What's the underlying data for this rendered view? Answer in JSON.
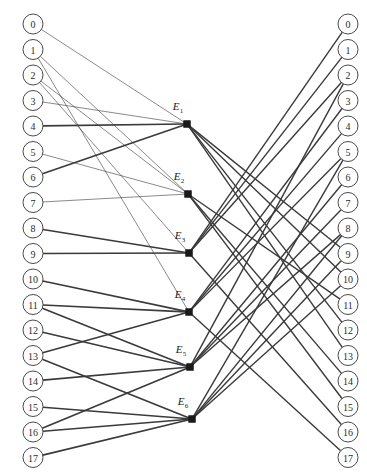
{
  "figure": {
    "type": "bipartite-flow-diagram",
    "width": 367,
    "height": 474,
    "background": "#ffffff",
    "edge_color": "#3a3a3a",
    "node_stroke": "#4a4a4a",
    "node_fill": "#ffffff",
    "middle_node_color": "#1a1a1a"
  },
  "left_column": {
    "name": "input-nodes",
    "x": 33,
    "start_y": 24,
    "spacing": 25.5,
    "radius": 10,
    "labels": [
      "0",
      "1",
      "2",
      "3",
      "4",
      "5",
      "6",
      "7",
      "8",
      "9",
      "10",
      "11",
      "12",
      "13",
      "14",
      "15",
      "16",
      "17"
    ]
  },
  "right_column": {
    "name": "output-nodes",
    "x": 348,
    "start_y": 24,
    "spacing": 25.5,
    "radius": 10,
    "labels": [
      "0",
      "1",
      "2",
      "3",
      "4",
      "5",
      "6",
      "7",
      "8",
      "9",
      "10",
      "11",
      "12",
      "13",
      "14",
      "15",
      "16",
      "17"
    ]
  },
  "middle_column": {
    "name": "relay-nodes",
    "nodes": [
      {
        "id": "E1",
        "base": "E",
        "sub": "1",
        "x": 187,
        "y": 124,
        "label_x": 178,
        "label_y": 110
      },
      {
        "id": "E2",
        "base": "E",
        "sub": "2",
        "x": 188,
        "y": 194,
        "label_x": 179,
        "label_y": 180
      },
      {
        "id": "E3",
        "base": "E",
        "sub": "3",
        "x": 189,
        "y": 253,
        "label_x": 180,
        "label_y": 239
      },
      {
        "id": "E4",
        "base": "E",
        "sub": "4",
        "x": 189,
        "y": 312,
        "label_x": 180,
        "label_y": 298
      },
      {
        "id": "E5",
        "base": "E",
        "sub": "5",
        "x": 190,
        "y": 367,
        "label_x": 181,
        "label_y": 353
      },
      {
        "id": "E6",
        "base": "E",
        "sub": "6",
        "x": 192,
        "y": 419,
        "label_x": 183,
        "label_y": 405
      }
    ]
  },
  "edges_left": [
    {
      "from": 0,
      "to": "E1",
      "weight": 0.6
    },
    {
      "from": 3,
      "to": "E1",
      "weight": 0.6
    },
    {
      "from": 4,
      "to": "E1",
      "weight": 1.6
    },
    {
      "from": 6,
      "to": "E1",
      "weight": 1.6
    },
    {
      "from": 1,
      "to": "E2",
      "weight": 0.6
    },
    {
      "from": 2,
      "to": "E2",
      "weight": 0.6
    },
    {
      "from": 5,
      "to": "E2",
      "weight": 0.6
    },
    {
      "from": 7,
      "to": "E2",
      "weight": 0.6
    },
    {
      "from": 2,
      "to": "E3",
      "weight": 0.6
    },
    {
      "from": 8,
      "to": "E3",
      "weight": 1.6
    },
    {
      "from": 9,
      "to": "E3",
      "weight": 1.6
    },
    {
      "from": 1,
      "to": "E4",
      "weight": 0.6
    },
    {
      "from": 10,
      "to": "E4",
      "weight": 1.6
    },
    {
      "from": 11,
      "to": "E4",
      "weight": 1.6
    },
    {
      "from": 13,
      "to": "E4",
      "weight": 1.6
    },
    {
      "from": 11,
      "to": "E5",
      "weight": 1.6
    },
    {
      "from": 12,
      "to": "E5",
      "weight": 1.6
    },
    {
      "from": 14,
      "to": "E5",
      "weight": 1.6
    },
    {
      "from": 16,
      "to": "E5",
      "weight": 1.6
    },
    {
      "from": 13,
      "to": "E6",
      "weight": 1.6
    },
    {
      "from": 15,
      "to": "E6",
      "weight": 1.6
    },
    {
      "from": 16,
      "to": "E6",
      "weight": 1.6
    },
    {
      "from": 17,
      "to": "E6",
      "weight": 1.6
    }
  ],
  "edges_right": [
    {
      "from": "E1",
      "to": 9,
      "weight": 1.4
    },
    {
      "from": "E1",
      "to": 10,
      "weight": 1.4
    },
    {
      "from": "E1",
      "to": 12,
      "weight": 1.4
    },
    {
      "from": "E1",
      "to": 13,
      "weight": 1.4
    },
    {
      "from": "E2",
      "to": 11,
      "weight": 1.4
    },
    {
      "from": "E2",
      "to": 14,
      "weight": 1.4
    },
    {
      "from": "E2",
      "to": 15,
      "weight": 1.4
    },
    {
      "from": "E3",
      "to": 0,
      "weight": 1.4
    },
    {
      "from": "E3",
      "to": 1,
      "weight": 1.4
    },
    {
      "from": "E3",
      "to": 2,
      "weight": 1.4
    },
    {
      "from": "E3",
      "to": 16,
      "weight": 1.4
    },
    {
      "from": "E4",
      "to": 3,
      "weight": 1.4
    },
    {
      "from": "E4",
      "to": 4,
      "weight": 1.4
    },
    {
      "from": "E4",
      "to": 5,
      "weight": 1.4
    },
    {
      "from": "E4",
      "to": 17,
      "weight": 1.4
    },
    {
      "from": "E5",
      "to": 2,
      "weight": 1.4
    },
    {
      "from": "E5",
      "to": 6,
      "weight": 1.4
    },
    {
      "from": "E5",
      "to": 7,
      "weight": 1.4
    },
    {
      "from": "E5",
      "to": 8,
      "weight": 1.4
    },
    {
      "from": "E6",
      "to": 5,
      "weight": 1.4
    },
    {
      "from": "E6",
      "to": 8,
      "weight": 1.4
    },
    {
      "from": "E6",
      "to": 9,
      "weight": 1.4
    },
    {
      "from": "E6",
      "to": 10,
      "weight": 1.4
    }
  ]
}
